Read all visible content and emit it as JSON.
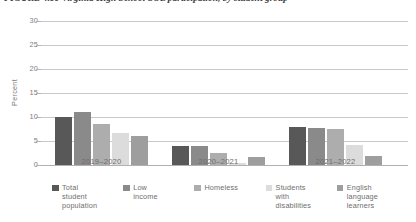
{
  "figure": {
    "title": "FIGURE 4.10  Virginia High School SOL participation, by student group"
  },
  "chart_data": {
    "type": "bar",
    "title": "FIGURE 4.10  Virginia High School SOL participation, by student group",
    "xlabel": "",
    "ylabel": "Percent",
    "ylim": [
      0,
      30
    ],
    "yticks": [
      0,
      5,
      10,
      15,
      20,
      25,
      30
    ],
    "ytick_labels": [
      "0",
      "5",
      "10",
      "15",
      "20",
      "25",
      "30"
    ],
    "grid": true,
    "legend_position": "bottom",
    "categories": [
      "2019–2020",
      "2020–2021",
      "2021–2022"
    ],
    "series": [
      {
        "name": "Total student population",
        "color": "#585858",
        "values": [
          10.0,
          4.0,
          8.0
        ]
      },
      {
        "name": "Low income",
        "color": "#8a8a8a",
        "values": [
          11.0,
          3.9,
          7.7
        ]
      },
      {
        "name": "Homeless",
        "color": "#adadad",
        "values": [
          8.5,
          2.6,
          7.4
        ]
      },
      {
        "name": "Students with disabilities",
        "color": "#dcdcdc",
        "values": [
          6.6,
          0.4,
          4.2
        ]
      },
      {
        "name": "English language learners",
        "color": "#9e9e9e",
        "values": [
          6.1,
          1.6,
          1.9
        ]
      }
    ]
  },
  "legend": {
    "items": [
      {
        "label": "Total\nstudent\npopulation",
        "color": "#585858"
      },
      {
        "label": "Low\nincome",
        "color": "#8a8a8a"
      },
      {
        "label": "Homeless",
        "color": "#adadad"
      },
      {
        "label": "Students\nwith\ndisabilities",
        "color": "#dcdcdc"
      },
      {
        "label": "English\nlanguage\nlearners",
        "color": "#9e9e9e"
      }
    ]
  }
}
